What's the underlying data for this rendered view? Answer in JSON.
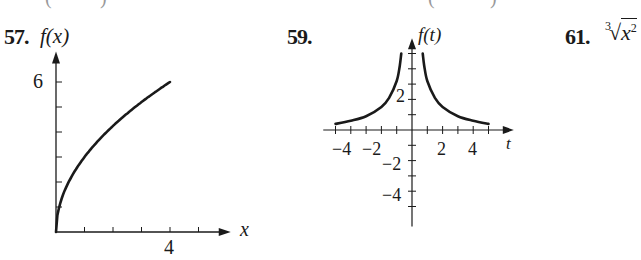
{
  "top_fragments": [
    "(",
    ")",
    "(",
    ")"
  ],
  "problems": [
    {
      "number": "57.",
      "ylabel": "f(x)",
      "xlabel": "x",
      "ytick_label": "6",
      "xtick_label": "4"
    },
    {
      "number": "59.",
      "ylabel": "f(t)",
      "xlabel": "t",
      "xtick_labels": [
        "−4",
        "−2",
        "2",
        "4"
      ],
      "ytick_labels": [
        "2",
        "−2",
        "−4"
      ]
    },
    {
      "number": "61.",
      "expression_index": "3",
      "expression_radicand": "x",
      "expression_exponent": "2"
    }
  ],
  "chart_data": [
    {
      "type": "line",
      "title": "57.",
      "xlabel": "x",
      "ylabel": "f(x)",
      "xlim": [
        0,
        5.5
      ],
      "ylim": [
        0,
        6.5
      ],
      "x_ticks": [
        1,
        2,
        3,
        4,
        5
      ],
      "x_tick_labels": {
        "4": "4"
      },
      "y_ticks": [
        1,
        2,
        3,
        4,
        5,
        6
      ],
      "y_tick_labels": {
        "6": "6"
      },
      "grid": false,
      "series": [
        {
          "name": "f(x)",
          "x": [
            0,
            0.05,
            0.25,
            0.5,
            1,
            1.5,
            2,
            2.5,
            3,
            3.5,
            4
          ],
          "y": [
            0,
            0.67,
            1.5,
            2.12,
            3,
            3.67,
            4.24,
            4.74,
            5.2,
            5.61,
            6
          ]
        }
      ]
    },
    {
      "type": "line",
      "title": "59.",
      "xlabel": "t",
      "ylabel": "f(t)",
      "xlim": [
        -5.8,
        6
      ],
      "ylim": [
        -6.3,
        5.6
      ],
      "x_ticks": [
        -5,
        -4,
        -3,
        -2,
        -1,
        1,
        2,
        3,
        4,
        5
      ],
      "y_ticks": [
        -5,
        -4,
        -3,
        -2,
        -1,
        1,
        2,
        3,
        4,
        5
      ],
      "grid": false,
      "series": [
        {
          "name": "f(t) left",
          "x": [
            -5,
            -4,
            -3,
            -2,
            -1.5,
            -1,
            -0.8,
            -0.7
          ],
          "y": [
            0.4,
            0.6,
            0.9,
            1.5,
            2.1,
            3.2,
            4.2,
            5.0
          ]
        },
        {
          "name": "f(t) right",
          "x": [
            0.7,
            0.8,
            1,
            1.5,
            2,
            3,
            4,
            5
          ],
          "y": [
            5.0,
            4.2,
            3.2,
            2.1,
            1.5,
            0.9,
            0.6,
            0.4
          ]
        }
      ]
    }
  ]
}
